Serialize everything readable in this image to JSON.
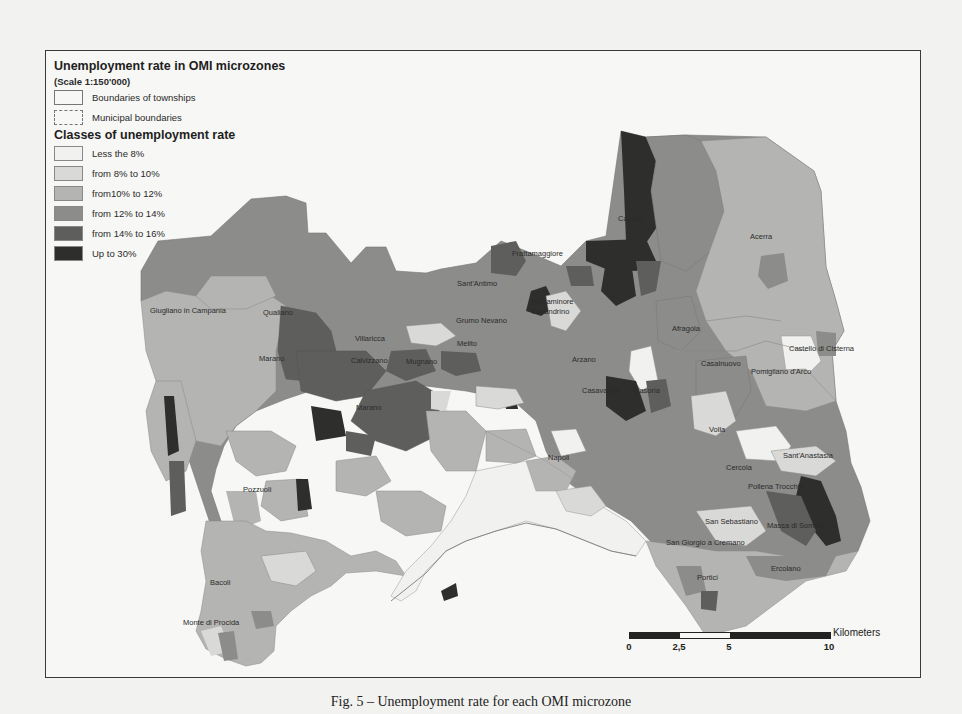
{
  "map": {
    "title": "Unemployment rate in OMI microzones",
    "scale": "(Scale 1:150'000)",
    "boundary_legend": [
      {
        "label": "Boundaries of townships",
        "style": "solid"
      },
      {
        "label": "Municipal boundaries",
        "style": "dashed"
      }
    ],
    "classes_title": "Classes of unemployment rate",
    "classes": [
      {
        "label": "Less the 8%",
        "color": "#f1f1ef"
      },
      {
        "label": "from 8% to 10%",
        "color": "#d9d9d7"
      },
      {
        "label": "from10% to 12%",
        "color": "#b4b4b2"
      },
      {
        "label": "from 12% to 14%",
        "color": "#8c8c8a"
      },
      {
        "label": "from 14% to 16%",
        "color": "#5e5e5c"
      },
      {
        "label": "Up to 30%",
        "color": "#2e2e2d"
      }
    ],
    "places": [
      {
        "name": "Giugliano in Campania",
        "x": 149,
        "y": 305
      },
      {
        "name": "Qualiano",
        "x": 262,
        "y": 307
      },
      {
        "name": "Villaricca",
        "x": 354,
        "y": 333
      },
      {
        "name": "Marano",
        "x": 258,
        "y": 353
      },
      {
        "name": "Calvizzano",
        "x": 350,
        "y": 355
      },
      {
        "name": "Mugnano",
        "x": 405,
        "y": 356
      },
      {
        "name": "Marano",
        "x": 355,
        "y": 402
      },
      {
        "name": "Sant'Antimo",
        "x": 456,
        "y": 278
      },
      {
        "name": "Grumo Nevano",
        "x": 455,
        "y": 315
      },
      {
        "name": "Melito",
        "x": 456,
        "y": 338
      },
      {
        "name": "Frattamaggiore",
        "x": 511,
        "y": 248
      },
      {
        "name": "Caivano",
        "x": 617,
        "y": 213
      },
      {
        "name": "Acerra",
        "x": 749,
        "y": 231
      },
      {
        "name": "Frattaminore",
        "x": 530,
        "y": 296
      },
      {
        "name": "Casandrino",
        "x": 530,
        "y": 306
      },
      {
        "name": "Afragola",
        "x": 671,
        "y": 323
      },
      {
        "name": "Arzano",
        "x": 571,
        "y": 354
      },
      {
        "name": "Casavatore",
        "x": 581,
        "y": 385
      },
      {
        "name": "Casoria",
        "x": 633,
        "y": 385
      },
      {
        "name": "Casalnuovo",
        "x": 700,
        "y": 358
      },
      {
        "name": "Castello di Cisterna",
        "x": 788,
        "y": 343
      },
      {
        "name": "Pomigliano d'Arco",
        "x": 750,
        "y": 366
      },
      {
        "name": "Volla",
        "x": 708,
        "y": 424
      },
      {
        "name": "Napoli",
        "x": 547,
        "y": 452
      },
      {
        "name": "Sant'Anastasia",
        "x": 782,
        "y": 450
      },
      {
        "name": "Cercola",
        "x": 725,
        "y": 462
      },
      {
        "name": "Pollena Trocchia",
        "x": 747,
        "y": 481
      },
      {
        "name": "San Sebastiano",
        "x": 704,
        "y": 516
      },
      {
        "name": "Massa di Somma",
        "x": 766,
        "y": 520
      },
      {
        "name": "San Giorgio a Cremano",
        "x": 665,
        "y": 537
      },
      {
        "name": "Portici",
        "x": 696,
        "y": 572
      },
      {
        "name": "Ercolano",
        "x": 770,
        "y": 563
      },
      {
        "name": "Pozzuoli",
        "x": 242,
        "y": 484
      },
      {
        "name": "Bacoli",
        "x": 209,
        "y": 577
      },
      {
        "name": "Monte di Procida",
        "x": 182,
        "y": 617
      }
    ]
  },
  "scale_bar": {
    "unit": "Kilometers",
    "ticks": [
      "0",
      "2,5",
      "5",
      "10"
    ]
  },
  "caption": "Fig. 5 – Unemployment rate for each OMI microzone"
}
